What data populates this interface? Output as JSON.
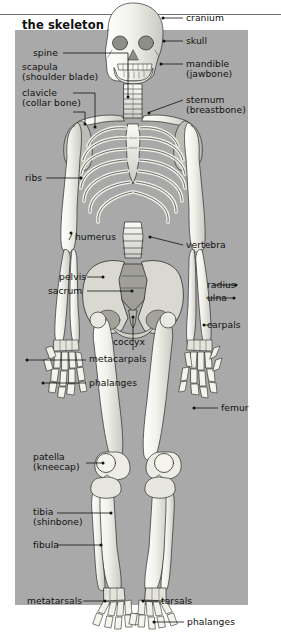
{
  "figure": {
    "title": "the skeleton",
    "plate_color": "#a9a9a9",
    "bone_fill": "#efefe8",
    "bone_stroke": "#2b2b2b",
    "label_color": "#111111",
    "background": "#ffffff"
  },
  "labels": {
    "cranium": "cranium",
    "skull": "skull",
    "mandible_l1": "mandible",
    "mandible_l2": "(jawbone)",
    "sternum_l1": "sternum",
    "sternum_l2": "(breastbone)",
    "spine": "spine",
    "scapula_l1": "scapula",
    "scapula_l2": "(shoulder blade)",
    "clavicle_l1": "clavicle",
    "clavicle_l2": "(collar bone)",
    "ribs": "ribs",
    "humerus": "humerus",
    "vertebra": "vertebra",
    "pelvis": "pelvis",
    "sacrum": "sacrum",
    "radius": "radius",
    "ulna": "ulna",
    "carpals": "carpals",
    "coccyx": "coccyx",
    "metacarpals": "metacarpals",
    "phalanges_hand": "phalanges",
    "femur": "femur",
    "patella_l1": "patella",
    "patella_l2": "(kneecap)",
    "tibia_l1": "tibia",
    "tibia_l2": "(shinbone)",
    "fibula": "fibula",
    "metatarsals": "metatarsals",
    "tarsals": "tarsals",
    "phalanges_foot": "phalanges"
  },
  "bone_parts": [
    "cranium",
    "skull",
    "mandible",
    "spine",
    "scapula",
    "clavicle",
    "sternum",
    "ribs",
    "humerus",
    "vertebra",
    "pelvis",
    "sacrum",
    "radius",
    "ulna",
    "carpals",
    "coccyx",
    "metacarpals",
    "phalanges",
    "femur",
    "patella",
    "tibia",
    "fibula",
    "metatarsals",
    "tarsals"
  ]
}
